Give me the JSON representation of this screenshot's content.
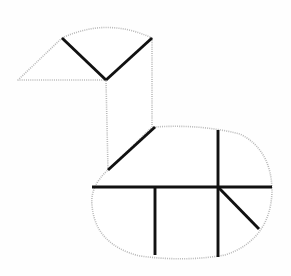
{
  "figure": {
    "canvas": {
      "width": 291,
      "height": 276
    },
    "colors": {
      "background": "#fefefe",
      "outline_stroke": "#b9b9b9",
      "cut_stroke": "#111111",
      "fill": "#ffffff"
    },
    "stroke_widths": {
      "outline": 1.6,
      "cut": 2.9
    },
    "outline_style": "dotted"
  },
  "shapes": {
    "head_fan": {
      "name": "head-fan",
      "path": "M 62 38 Q 107 17 152 38 L 106 80 Z",
      "arc_from": [
        62,
        38
      ],
      "arc_to": [
        152,
        38
      ],
      "apex": [
        106,
        80
      ]
    },
    "beak_triangle": {
      "name": "beak-triangle",
      "path": "M 62 38 L 18 80 L 106 80 Z",
      "points": [
        [
          62,
          38
        ],
        [
          18,
          80
        ],
        [
          106,
          80
        ]
      ]
    },
    "neck_band": {
      "name": "neck-band",
      "path": "M 106 80 L 152 38 L 152 127 L 108 170 Z",
      "points": [
        [
          106,
          80
        ],
        [
          152,
          38
        ],
        [
          152,
          127
        ],
        [
          108,
          170
        ]
      ]
    },
    "body_oval": {
      "name": "body-oval",
      "path": "M 155 127 L 108 170 Q 90 186 92 205 Q 95 245 140 256 Q 185 262 225 255 Q 270 240 272 192 Q 272 150 240 134 Q 200 124 155 127 Z",
      "left_extent": 90,
      "right_extent": 272,
      "top_extent": 127,
      "bottom_extent": 258
    }
  },
  "cut_lines": [
    {
      "name": "head-cut-left",
      "from": [
        62,
        38
      ],
      "to": [
        106,
        80
      ]
    },
    {
      "name": "head-cut-right",
      "from": [
        152,
        38
      ],
      "to": [
        106,
        80
      ]
    },
    {
      "name": "neck-cut-diagonal",
      "from": [
        108,
        170
      ],
      "to": [
        155,
        127
      ]
    },
    {
      "name": "body-cut-horizontal",
      "from": [
        92,
        187
      ],
      "to": [
        272,
        187
      ]
    },
    {
      "name": "body-cut-vertical-left",
      "from": [
        155,
        187
      ],
      "to": [
        155,
        255
      ]
    },
    {
      "name": "body-cut-vertical-center",
      "from": [
        218,
        187
      ],
      "to": [
        218,
        257
      ]
    },
    {
      "name": "body-cut-vertical-up",
      "from": [
        218,
        130
      ],
      "to": [
        218,
        187
      ]
    },
    {
      "name": "body-cut-diagonal-right",
      "from": [
        218,
        187
      ],
      "to": [
        259,
        229
      ]
    }
  ],
  "vertices": [
    {
      "name": "beak-tip",
      "x": 18,
      "y": 80
    },
    {
      "name": "head-arc-left",
      "x": 62,
      "y": 38
    },
    {
      "name": "head-arc-right",
      "x": 152,
      "y": 38
    },
    {
      "name": "head-apex",
      "x": 106,
      "y": 80
    },
    {
      "name": "neck-bottom-left",
      "x": 108,
      "y": 170
    },
    {
      "name": "neck-bottom-right",
      "x": 155,
      "y": 127
    },
    {
      "name": "body-cross-junction",
      "x": 218,
      "y": 187
    }
  ]
}
